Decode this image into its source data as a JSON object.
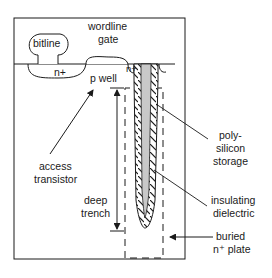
{
  "diagram": {
    "labels": {
      "bitline": "bitline",
      "wordline_1": "wordline",
      "wordline_2": "gate",
      "n_plus_left": "n+",
      "n_plus_right": "n+",
      "p_well": "p well",
      "access_1": "access",
      "access_2": "transistor",
      "deep_1": "deep",
      "deep_2": "trench",
      "poly_1": "poly-",
      "poly_2": "silicon",
      "poly_3": "storage",
      "insul_1": "insulating",
      "insul_2": "dielectric",
      "buried_1": "buried",
      "buried_2": "n⁺ plate"
    },
    "colors": {
      "line": "#1a1a1a",
      "polysilicon_fill": "#c8c8c8",
      "background": "#ffffff"
    }
  }
}
